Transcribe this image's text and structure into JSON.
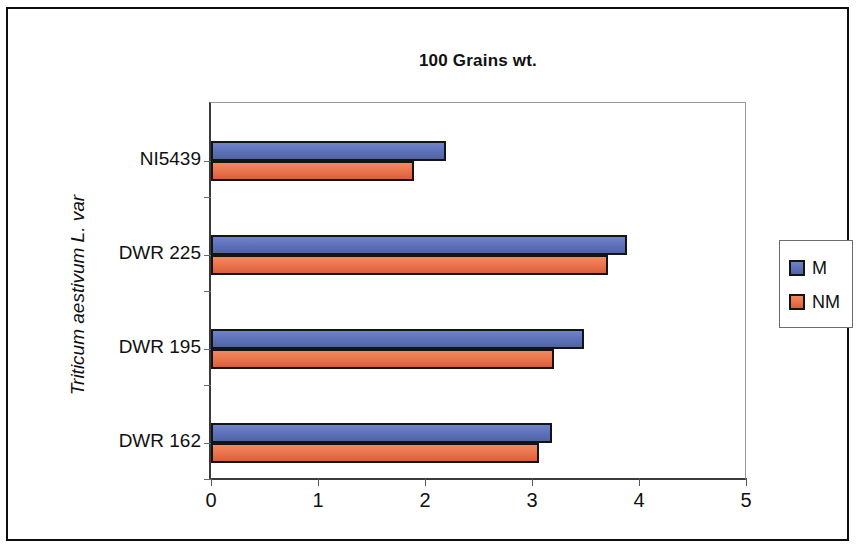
{
  "chart_data": {
    "type": "bar",
    "orientation": "horizontal",
    "title": "100 Grains wt.",
    "xlabel": "",
    "ylabel": "Triticum aestivum L. var",
    "categories": [
      "DWR 162",
      "DWR 195",
      "DWR 225",
      "NI5439"
    ],
    "series": [
      {
        "name": "M",
        "color": "#5c70ba",
        "values": [
          3.19,
          3.49,
          3.89,
          2.2
        ]
      },
      {
        "name": "NM",
        "color": "#ea724a",
        "values": [
          3.07,
          3.21,
          3.71,
          1.9
        ]
      }
    ],
    "xlim": [
      0,
      5
    ],
    "xticks": [
      "0",
      "1",
      "2",
      "3",
      "4",
      "5"
    ],
    "xtick_values": [
      0,
      1,
      2,
      3,
      4,
      5
    ],
    "grid": false,
    "legend_position": "right"
  },
  "legend": {
    "entries": [
      {
        "label": "M"
      },
      {
        "label": "NM"
      }
    ]
  }
}
